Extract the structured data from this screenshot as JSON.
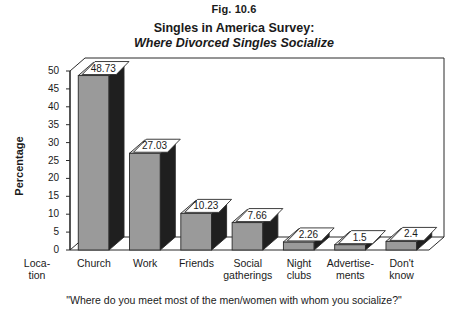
{
  "figure": {
    "number": "Fig. 10.6",
    "title_line1": "Singles in America Survey:",
    "title_line2": "Where Divorced Singles Socialize",
    "caption": "\"Where do you meet most of the men/women with whom you socialize?\""
  },
  "chart_data": {
    "type": "bar",
    "title": "Singles in America Survey: Where Divorced Singles Socialize",
    "xlabel": "Location",
    "ylabel": "Percentage",
    "ylim": [
      0,
      50
    ],
    "yticks": [
      0,
      5,
      10,
      15,
      20,
      25,
      30,
      35,
      40,
      45,
      50
    ],
    "grid": false,
    "legend": "none",
    "three_d": true,
    "categories": [
      "Church",
      "Work",
      "Friends",
      "Social gatherings",
      "Night clubs",
      "Advertisements",
      "Don't know"
    ],
    "category_labels_wrapped": [
      "Church",
      "Work",
      "Friends",
      "Social\ngatherings",
      "Night\nclubs",
      "Advertise-\nments",
      "Don't\nknow"
    ],
    "values": [
      48.73,
      27.03,
      10.23,
      7.66,
      2.26,
      1.5,
      2.4
    ],
    "value_labels": [
      "48.73",
      "27.03",
      "10.23",
      "7.66",
      "2.26",
      "1.5",
      "2.4"
    ],
    "colors": {
      "bar_front": "#9a9a9a",
      "bar_side": "#1f1f1f",
      "bar_top": "#d8d8d8",
      "axis": "#2a2a2a",
      "label_box": "#ffffff",
      "text": "#1a1a1a"
    }
  },
  "axis": {
    "x_origin_label": "Loca-\ntion",
    "y_tick_labels": [
      "50",
      "45",
      "40",
      "35",
      "30",
      "25",
      "20",
      "15",
      "10",
      "5",
      "0"
    ]
  }
}
